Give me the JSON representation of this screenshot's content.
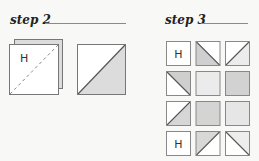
{
  "step2": {
    "title": "step 2",
    "stacked_square": {
      "label": "H",
      "front_fill": "#ffffff",
      "back_fill": "#dcdcdc",
      "diagonal": "dashed"
    },
    "split_square": {
      "top_left_fill": "#ffffff",
      "bottom_right_fill": "#dcdcdc"
    }
  },
  "step3": {
    "title": "step 3",
    "grid": [
      [
        {
          "type": "label",
          "label": "H"
        },
        {
          "type": "diag-down",
          "gray": "bottom-left",
          "shade": "#cfcfcf"
        },
        {
          "type": "diag-up",
          "gray": "bottom-right",
          "shade": "#ececec"
        }
      ],
      [
        {
          "type": "diag-down",
          "gray": "top-right",
          "shade": "#cfcfcf"
        },
        {
          "type": "solid",
          "shade": "#ebebeb"
        },
        {
          "type": "solid",
          "shade": "#d2d2d2"
        }
      ],
      [
        {
          "type": "diag-up",
          "gray": "bottom-right",
          "shade": "#d6d6d6"
        },
        {
          "type": "solid",
          "shade": "#d4d4d4"
        },
        {
          "type": "solid",
          "shade": "#e6e6e6"
        }
      ],
      [
        {
          "type": "label",
          "label": "H"
        },
        {
          "type": "diag-up",
          "gray": "top-left",
          "shade": "#d8d8d8"
        },
        {
          "type": "diag-down",
          "gray": "top-right",
          "shade": "#ededed"
        }
      ]
    ]
  }
}
